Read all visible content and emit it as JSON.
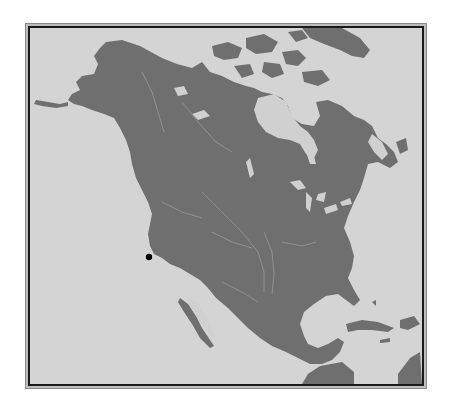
{
  "map": {
    "region": "North America",
    "style": "grayscale physical outline with rivers and lakes",
    "colors": {
      "water": "#d4d4d4",
      "land": "#6f6f6f",
      "rivers_lakes": "#b8b8b8",
      "frame": "#1a1a1a",
      "marker": "#000000"
    },
    "markers": [
      {
        "name": "location-marker",
        "approx_location": "Northern California coast",
        "x": 147,
        "y": 255
      }
    ]
  }
}
